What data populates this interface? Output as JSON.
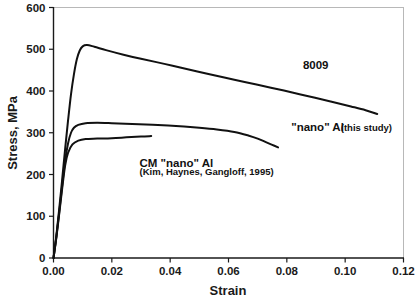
{
  "chart_data": {
    "type": "line",
    "title": "",
    "xlabel": "Strain",
    "ylabel": "Stress, MPa",
    "xlim": [
      0.0,
      0.12
    ],
    "ylim": [
      0,
      600
    ],
    "grid": false,
    "legend": "inline-annotations",
    "xticks": [
      "0.00",
      "0.02",
      "0.04",
      "0.06",
      "0.08",
      "0.10",
      "0.12"
    ],
    "xtick_values": [
      0.0,
      0.02,
      0.04,
      0.06,
      0.08,
      0.1,
      0.12
    ],
    "yticks": [
      "0",
      "100",
      "200",
      "300",
      "400",
      "500",
      "600"
    ],
    "ytick_values": [
      0,
      100,
      200,
      300,
      400,
      500,
      600
    ],
    "series": [
      {
        "name": "8009",
        "color": "#111111",
        "x": [
          0.0,
          0.001,
          0.002,
          0.003,
          0.004,
          0.005,
          0.006,
          0.007,
          0.008,
          0.009,
          0.01,
          0.0115,
          0.014,
          0.018,
          0.024,
          0.03,
          0.038,
          0.046,
          0.0535,
          0.062,
          0.07,
          0.079,
          0.087,
          0.095,
          0.102,
          0.107,
          0.111
        ],
        "y": [
          0,
          55,
          120,
          190,
          262,
          330,
          392,
          440,
          476,
          497,
          507,
          510,
          506,
          498,
          487,
          477,
          465,
          452,
          440,
          427,
          415,
          401,
          388,
          375,
          363,
          354,
          345
        ]
      },
      {
        "name": "\"nano\" Al (this study)",
        "color": "#111111",
        "x": [
          0.0,
          0.001,
          0.002,
          0.003,
          0.004,
          0.005,
          0.006,
          0.007,
          0.0085,
          0.011,
          0.015,
          0.02,
          0.027,
          0.034,
          0.042,
          0.05,
          0.056,
          0.062,
          0.067,
          0.07,
          0.073,
          0.075,
          0.077
        ],
        "y": [
          0,
          52,
          112,
          175,
          234,
          275,
          300,
          312,
          319,
          323,
          324,
          323,
          321,
          319,
          316,
          312,
          308,
          302,
          293,
          286,
          277,
          271,
          265
        ]
      },
      {
        "name": "CM \"nano\" Al (Kim, Haynes, Gangloff, 1995)",
        "color": "#111111",
        "x": [
          0.0,
          0.001,
          0.002,
          0.003,
          0.004,
          0.005,
          0.0065,
          0.0085,
          0.011,
          0.015,
          0.02,
          0.025,
          0.03,
          0.0335
        ],
        "y": [
          0,
          50,
          108,
          168,
          222,
          252,
          272,
          281,
          285,
          286,
          287,
          289,
          291,
          292
        ]
      }
    ],
    "annotations": [
      {
        "name": "8009",
        "text": "8009",
        "x": 0.0855,
        "y": 452
      },
      {
        "name": "nano-al-main",
        "text": "\"nano\" Al",
        "x": 0.0815,
        "y": 305
      },
      {
        "name": "nano-al-sub",
        "text": "(this study)",
        "x": 0.0985,
        "y": 305
      },
      {
        "name": "cm-nano-al-main",
        "text": "CM \"nano\" Al",
        "x": 0.0295,
        "y": 218
      },
      {
        "name": "cm-nano-al-sub",
        "text": "(Kim, Haynes, Gangloff, 1995)",
        "x": 0.0295,
        "y": 198
      }
    ]
  }
}
